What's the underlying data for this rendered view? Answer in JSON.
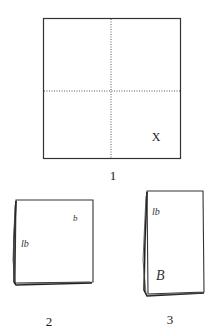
{
  "figures": [
    {
      "id": "1",
      "caption": "1",
      "description": "Square sheet divided into quarters by dotted fold lines",
      "corner_mark": "X"
    },
    {
      "id": "2",
      "caption": "2",
      "description": "Square folded into quarters",
      "marks": [
        "b",
        "lb"
      ]
    },
    {
      "id": "3",
      "caption": "3",
      "description": "Folded into a tall rectangle",
      "marks": [
        "lb",
        "B"
      ]
    }
  ],
  "colors": {
    "line": "#333333",
    "background": "#ffffff"
  }
}
